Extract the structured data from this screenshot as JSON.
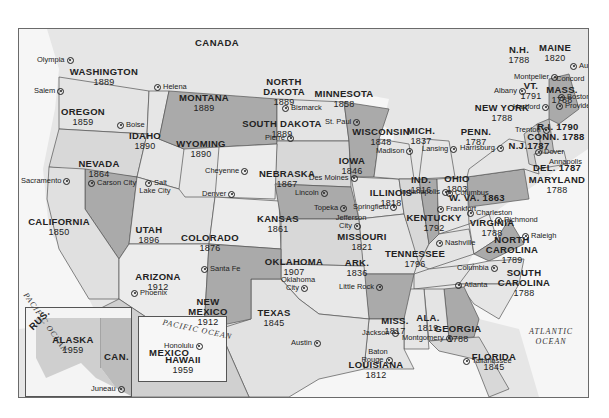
{
  "map": {
    "countries": {
      "canada": "CANADA",
      "mexico": "MEXICO",
      "russia": "RUS.",
      "canada_inset": "CAN."
    },
    "oceans": {
      "pacific": "PACIFIC OCEAN",
      "atlantic_line1": "ATLANTIC",
      "atlantic_line2": "OCEAN",
      "pacific_hawaii": "PACIFIC OCEAN"
    },
    "states": [
      {
        "name": "WASHINGTON",
        "year": "1889",
        "capital": "Olympia"
      },
      {
        "name": "OREGON",
        "year": "1859",
        "capital": "Salem"
      },
      {
        "name": "IDAHO",
        "year": "1890",
        "capital": "Boise"
      },
      {
        "name": "MONTANA",
        "year": "1889",
        "capital": "Helena"
      },
      {
        "name": "NORTH DAKOTA",
        "year": "1889",
        "capital": "Bismarck"
      },
      {
        "name": "SOUTH DAKOTA",
        "year": "1889",
        "capital": "Pierre"
      },
      {
        "name": "MINNESOTA",
        "year": "1858",
        "capital": "St. Paul"
      },
      {
        "name": "WISCONSIN",
        "year": "1848",
        "capital": "Madison"
      },
      {
        "name": "MICH.",
        "year": "1837",
        "capital": "Lansing"
      },
      {
        "name": "WYOMING",
        "year": "1890",
        "capital": "Cheyenne"
      },
      {
        "name": "NEVADA",
        "year": "1864",
        "capital": "Carson City"
      },
      {
        "name": "CALIFORNIA",
        "year": "1850",
        "capital": "Sacramento"
      },
      {
        "name": "UTAH",
        "year": "1896",
        "capital": "Salt Lake City"
      },
      {
        "name": "COLORADO",
        "year": "1876",
        "capital": "Denver"
      },
      {
        "name": "NEBRASKA",
        "year": "1867",
        "capital": "Lincoln"
      },
      {
        "name": "IOWA",
        "year": "1846",
        "capital": "Des Moines"
      },
      {
        "name": "ILLINOIS",
        "year": "1818",
        "capital": "Springfield"
      },
      {
        "name": "IND.",
        "year": "1816",
        "capital": "Indianapolis"
      },
      {
        "name": "OHIO",
        "year": "1803",
        "capital": "Columbus"
      },
      {
        "name": "KANSAS",
        "year": "1861",
        "capital": "Topeka"
      },
      {
        "name": "MISSOURI",
        "year": "1821",
        "capital": "Jefferson City"
      },
      {
        "name": "KENTUCKY",
        "year": "1792",
        "capital": "Frankfort"
      },
      {
        "name": "W. VA.",
        "year": "1863",
        "capital": "Charleston"
      },
      {
        "name": "VIRGINIA",
        "year": "1788",
        "capital": "Richmond"
      },
      {
        "name": "ARIZONA",
        "year": "1912",
        "capital": "Phoenix"
      },
      {
        "name": "NEW MEXICO",
        "year": "1912",
        "capital": "Santa Fe"
      },
      {
        "name": "OKLAHOMA",
        "year": "1907",
        "capital": "Oklahoma City"
      },
      {
        "name": "ARK.",
        "year": "1836",
        "capital": "Little Rock"
      },
      {
        "name": "TENNESSEE",
        "year": "1796",
        "capital": "Nashville"
      },
      {
        "name": "NORTH CAROLINA",
        "year": "1789",
        "capital": "Raleigh"
      },
      {
        "name": "SOUTH CAROLINA",
        "year": "1788",
        "capital": "Columbia"
      },
      {
        "name": "TEXAS",
        "year": "1845",
        "capital": "Austin"
      },
      {
        "name": "LOUISIANA",
        "year": "1812",
        "capital": "Baton Rouge"
      },
      {
        "name": "MISS.",
        "year": "1817",
        "capital": "Jackson"
      },
      {
        "name": "ALA.",
        "year": "1819",
        "capital": "Montgomery"
      },
      {
        "name": "GEORGIA",
        "year": "1788",
        "capital": "Atlanta"
      },
      {
        "name": "FLORIDA",
        "year": "1845",
        "capital": "Tallahassee"
      },
      {
        "name": "NEW YORK",
        "year": "1788",
        "capital": "Albany"
      },
      {
        "name": "PENN.",
        "year": "1787",
        "capital": "Harrisburg"
      },
      {
        "name": "N.J.",
        "year": "1787",
        "capital": "Trenton"
      },
      {
        "name": "DEL.",
        "year": "1787",
        "capital": "Dover"
      },
      {
        "name": "MARYLAND",
        "year": "1788",
        "capital": "Annapolis"
      },
      {
        "name": "CONN.",
        "year": "1788",
        "capital": "Hartford"
      },
      {
        "name": "R.I.",
        "year": "1790",
        "capital": "Providence"
      },
      {
        "name": "MASS.",
        "year": "1788",
        "capital": "Boston"
      },
      {
        "name": "VT.",
        "year": "1791",
        "capital": "Montpelier"
      },
      {
        "name": "N.H.",
        "year": "1788",
        "capital": "Concord"
      },
      {
        "name": "MAINE",
        "year": "1820",
        "capital": "Augusta"
      },
      {
        "name": "ALASKA",
        "year": "1959",
        "capital": "Juneau"
      },
      {
        "name": "HAWAII",
        "year": "1959",
        "capital": "Honolulu"
      }
    ],
    "combined_labels": {
      "nj": "N.J.1787",
      "del": "DEL. 1787",
      "ri": "R.I. 1790",
      "conn": "CONN. 1788",
      "wva": "W. VA. 1863"
    },
    "colors": {
      "dark_state": "#a9a9a9",
      "mid_state": "#cfcfcf",
      "light_state": "#e2e2e2",
      "water": "#f4f4f4",
      "border": "#555555"
    }
  }
}
